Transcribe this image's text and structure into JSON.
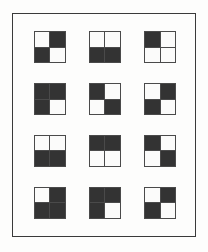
{
  "figure": {
    "frame": {
      "border_color": "#3a3a3a",
      "background_color": "#fdfdfc"
    },
    "colors": {
      "black": "#333333",
      "white": "#fbfbfa",
      "tile_border": "#4a4a4a",
      "sheet_background": "#fdfdfc"
    },
    "grid": {
      "columns": 3,
      "rows": 4,
      "tile_count": 12,
      "tile_quadrants": [
        "top-left",
        "top-right",
        "bottom-left",
        "bottom-right"
      ]
    }
  },
  "tiles": [
    {
      "index": 1,
      "row": 1,
      "column": 1,
      "name": "diagonal-white-black",
      "black_count": 2,
      "quadrants": {
        "top_left": "white",
        "top_right": "black",
        "bottom_left": "black",
        "bottom_right": "white"
      }
    },
    {
      "index": 2,
      "row": 1,
      "column": 2,
      "name": "bottom-half-black",
      "black_count": 2,
      "quadrants": {
        "top_left": "white",
        "top_right": "white",
        "bottom_left": "black",
        "bottom_right": "black"
      }
    },
    {
      "index": 3,
      "row": 1,
      "column": 3,
      "name": "top-left-black-only",
      "black_count": 1,
      "quadrants": {
        "top_left": "black",
        "top_right": "white",
        "bottom_left": "white",
        "bottom_right": "white"
      }
    },
    {
      "index": 4,
      "row": 2,
      "column": 1,
      "name": "bottom-right-white-only",
      "black_count": 3,
      "quadrants": {
        "top_left": "black",
        "top_right": "black",
        "bottom_left": "black",
        "bottom_right": "white"
      }
    },
    {
      "index": 5,
      "row": 2,
      "column": 2,
      "name": "antidiagonal-black-white",
      "black_count": 2,
      "quadrants": {
        "top_left": "black",
        "top_right": "white",
        "bottom_left": "white",
        "bottom_right": "black"
      }
    },
    {
      "index": 6,
      "row": 2,
      "column": 3,
      "name": "diagonal-white-black",
      "black_count": 2,
      "quadrants": {
        "top_left": "white",
        "top_right": "black",
        "bottom_left": "black",
        "bottom_right": "white"
      }
    },
    {
      "index": 7,
      "row": 3,
      "column": 1,
      "name": "bottom-half-black",
      "black_count": 2,
      "quadrants": {
        "top_left": "white",
        "top_right": "white",
        "bottom_left": "black",
        "bottom_right": "black"
      }
    },
    {
      "index": 8,
      "row": 3,
      "column": 2,
      "name": "top-half-black",
      "black_count": 2,
      "quadrants": {
        "top_left": "black",
        "top_right": "black",
        "bottom_left": "white",
        "bottom_right": "white"
      }
    },
    {
      "index": 9,
      "row": 3,
      "column": 3,
      "name": "antidiagonal-black-white",
      "black_count": 2,
      "quadrants": {
        "top_left": "black",
        "top_right": "white",
        "bottom_left": "white",
        "bottom_right": "black"
      }
    },
    {
      "index": 10,
      "row": 4,
      "column": 1,
      "name": "top-left-white-only",
      "black_count": 3,
      "quadrants": {
        "top_left": "white",
        "top_right": "black",
        "bottom_left": "black",
        "bottom_right": "black"
      }
    },
    {
      "index": 11,
      "row": 4,
      "column": 2,
      "name": "bottom-right-white-only",
      "black_count": 3,
      "quadrants": {
        "top_left": "black",
        "top_right": "black",
        "bottom_left": "black",
        "bottom_right": "white"
      }
    },
    {
      "index": 12,
      "row": 4,
      "column": 3,
      "name": "diagonal-white-black",
      "black_count": 2,
      "quadrants": {
        "top_left": "white",
        "top_right": "black",
        "bottom_left": "black",
        "bottom_right": "white"
      }
    }
  ]
}
